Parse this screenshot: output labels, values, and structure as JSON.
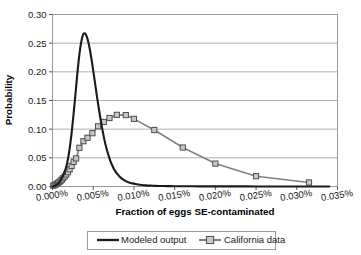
{
  "chart_data": {
    "type": "line",
    "title": "",
    "xlabel": "Fraction of eggs SE-contaminated",
    "ylabel": "Probability",
    "xlim": [
      0.0,
      0.035
    ],
    "ylim": [
      0.0,
      0.3
    ],
    "x_tick_labels": [
      "0.000%",
      "0.005%",
      "0.010%",
      "0.015%",
      "0.020%",
      "0.025%",
      "0.030%",
      "0.035%"
    ],
    "x_tick_values": [
      0.0,
      0.005,
      0.01,
      0.015,
      0.02,
      0.025,
      0.03,
      0.035
    ],
    "y_tick_labels": [
      "0.00",
      "0.05",
      "0.10",
      "0.15",
      "0.20",
      "0.25",
      "0.30"
    ],
    "y_tick_values": [
      0.0,
      0.05,
      0.1,
      0.15,
      0.2,
      0.25,
      0.3
    ],
    "grid": "horizontal",
    "legend_position": "bottom",
    "x_unit": "percent",
    "series": [
      {
        "name": "Modeled output",
        "style": "line",
        "color": "#1a1a1a",
        "line_width": 2.1,
        "marker": "none",
        "x": [
          0.0,
          0.0002,
          0.0004,
          0.0006,
          0.0008,
          0.001,
          0.0012,
          0.0014,
          0.0016,
          0.0018,
          0.002,
          0.0022,
          0.0024,
          0.0026,
          0.0028,
          0.003,
          0.0032,
          0.0034,
          0.0036,
          0.0038,
          0.004,
          0.0042,
          0.0044,
          0.0046,
          0.0048,
          0.005,
          0.0052,
          0.0054,
          0.0056,
          0.0058,
          0.006,
          0.0062,
          0.0064,
          0.0066,
          0.0068,
          0.007,
          0.0072,
          0.0074,
          0.0076,
          0.008,
          0.0084,
          0.0088,
          0.0092,
          0.0096,
          0.01,
          0.0105,
          0.011,
          0.0115,
          0.012,
          0.0125,
          0.013,
          0.014,
          0.015,
          0.016,
          0.018,
          0.02,
          0.022,
          0.025,
          0.028,
          0.031,
          0.034
        ],
        "y": [
          0.0,
          0.001,
          0.002,
          0.004,
          0.007,
          0.011,
          0.016,
          0.022,
          0.03,
          0.041,
          0.056,
          0.076,
          0.1,
          0.128,
          0.158,
          0.189,
          0.218,
          0.241,
          0.257,
          0.266,
          0.267,
          0.262,
          0.252,
          0.238,
          0.221,
          0.202,
          0.183,
          0.163,
          0.144,
          0.126,
          0.109,
          0.094,
          0.08,
          0.068,
          0.058,
          0.049,
          0.041,
          0.035,
          0.029,
          0.021,
          0.015,
          0.011,
          0.008,
          0.006,
          0.005,
          0.0035,
          0.0026,
          0.002,
          0.0015,
          0.0012,
          0.001,
          0.0007,
          0.0005,
          0.0004,
          0.0003,
          0.0002,
          0.0002,
          0.0001,
          0.0001,
          0.0001,
          0.0
        ]
      },
      {
        "name": "California data",
        "style": "line-marker",
        "color": "#808080",
        "line_width": 1.6,
        "marker": "square",
        "marker_size": 5.2,
        "marker_fill": "#c8c8c8",
        "marker_edge": "#4d4d4d",
        "x": [
          0.0001,
          0.00025,
          0.0004,
          0.00055,
          0.0007,
          0.00085,
          0.001,
          0.00115,
          0.0013,
          0.0015,
          0.0017,
          0.0019,
          0.0021,
          0.00235,
          0.0026,
          0.0029,
          0.0033,
          0.0038,
          0.0043,
          0.0049,
          0.0056,
          0.0063,
          0.007,
          0.0079,
          0.009,
          0.01,
          0.0125,
          0.016,
          0.02,
          0.025,
          0.0315
        ],
        "y": [
          0.0015,
          0.0025,
          0.0035,
          0.005,
          0.0065,
          0.008,
          0.01,
          0.012,
          0.0145,
          0.0175,
          0.021,
          0.025,
          0.03,
          0.036,
          0.043,
          0.049,
          0.0675,
          0.079,
          0.085,
          0.093,
          0.105,
          0.1125,
          0.1195,
          0.125,
          0.1245,
          0.118,
          0.0985,
          0.068,
          0.04,
          0.018,
          0.007
        ]
      }
    ]
  },
  "legend": {
    "entries": [
      {
        "label": "Modeled output",
        "marker": "line"
      },
      {
        "label": "California data",
        "marker": "line-square"
      }
    ]
  },
  "colors": {
    "modeled_output": "#1a1a1a",
    "california_data": "#808080",
    "gridline": "#b0b0b0",
    "plot_border": "#9a9a9a",
    "axis": "#555555",
    "background": "#ffffff"
  }
}
